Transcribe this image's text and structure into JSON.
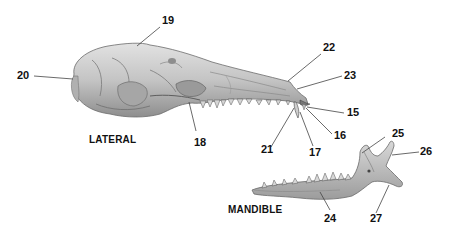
{
  "figure": {
    "views": [
      {
        "id": "lateral",
        "title": "LATERAL"
      },
      {
        "id": "mandible",
        "title": "MANDIBLE"
      }
    ],
    "labels": [
      {
        "number": "19",
        "view": "lateral",
        "target": "dorsal skull (cranium roof)"
      },
      {
        "number": "20",
        "view": "lateral",
        "target": "posterior skull (occipital region)"
      },
      {
        "number": "22",
        "view": "lateral",
        "target": "nasal bone tip"
      },
      {
        "number": "23",
        "view": "lateral",
        "target": "rostrum / premaxilla"
      },
      {
        "number": "15",
        "view": "lateral",
        "target": "incisor"
      },
      {
        "number": "16",
        "view": "lateral",
        "target": "anterior tooth"
      },
      {
        "number": "17",
        "view": "lateral",
        "target": "canine tooth"
      },
      {
        "number": "21",
        "view": "lateral",
        "target": "anterior tooth"
      },
      {
        "number": "18",
        "view": "lateral",
        "target": "zygomatic / maxilla region"
      },
      {
        "number": "25",
        "view": "mandible",
        "target": "coronoid process"
      },
      {
        "number": "26",
        "view": "mandible",
        "target": "condyloid process"
      },
      {
        "number": "24",
        "view": "mandible",
        "target": "mandible body"
      },
      {
        "number": "27",
        "view": "mandible",
        "target": "angular process"
      }
    ]
  },
  "colors": {
    "bone_fill": "#cfcfcf",
    "bone_shade": "#9a9a9a",
    "bone_dark": "#5a5a5a",
    "leader_line": "#444444",
    "label_text": "#111111"
  }
}
